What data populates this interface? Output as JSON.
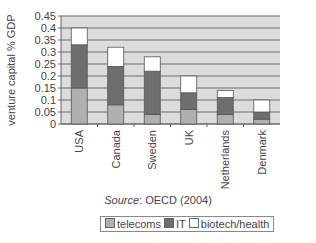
{
  "chart_data": {
    "type": "bar",
    "stacked": true,
    "title": "",
    "xlabel": "",
    "ylabel": "venture capital % GDP",
    "ylim": [
      0,
      0.45
    ],
    "yticks": [
      "0",
      "0.05",
      "0.1",
      "0.15",
      "0.2",
      "0.25",
      "0.3",
      "0.35",
      "0.4",
      "0.45"
    ],
    "grid": true,
    "categories": [
      "USA",
      "Canada",
      "Sweden",
      "UK",
      "Netherlands",
      "Denmark"
    ],
    "series": [
      {
        "name": "telecoms",
        "color": "#b0b0b0",
        "values": [
          0.15,
          0.08,
          0.04,
          0.06,
          0.04,
          0.02
        ]
      },
      {
        "name": "IT",
        "color": "#6e6e6e",
        "values": [
          0.18,
          0.16,
          0.18,
          0.07,
          0.07,
          0.03
        ]
      },
      {
        "name": "biotech/health",
        "color": "#ffffff",
        "values": [
          0.07,
          0.08,
          0.06,
          0.07,
          0.03,
          0.05
        ]
      }
    ],
    "totals": [
      0.4,
      0.32,
      0.28,
      0.2,
      0.14,
      0.1
    ],
    "source": "OECD (2004)",
    "legend_position": "bottom"
  },
  "source_label": "Source",
  "source_text": ": OECD (2004)",
  "legend": [
    {
      "label": "telecoms",
      "color": "#b0b0b0"
    },
    {
      "label": "IT",
      "color": "#6e6e6e"
    },
    {
      "label": "biotech/health",
      "color": "#ffffff"
    }
  ]
}
